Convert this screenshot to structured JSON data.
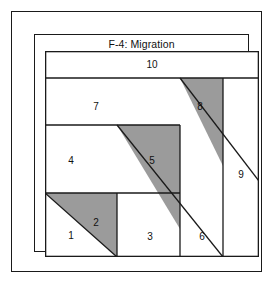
{
  "card": {
    "title": "F-4: Migration",
    "caption": "Foundation Paper Piecing Pattern A"
  },
  "colors": {
    "fabric_light": "#ffffff",
    "fabric_dark": "#9b9b9b",
    "seam_line": "#1a1a1a",
    "page_background": "#ffffff",
    "text": "#111111"
  },
  "pattern": {
    "name": "Foundation Paper Piecing Pattern A",
    "block_width": 214,
    "block_height": 206,
    "piece_count": 10,
    "pieces": [
      {
        "number": "1",
        "fabric": "light",
        "shape": "triangle",
        "points": "0,142 72,206 0,206",
        "label_x": 26,
        "label_y": 185
      },
      {
        "number": "2",
        "fabric": "dark",
        "shape": "triangle",
        "points": "0,142 72,142 72,206",
        "label_x": 51,
        "label_y": 172
      },
      {
        "number": "3",
        "fabric": "light",
        "shape": "polygon",
        "points": "72,142 135,142 135,206 72,206",
        "label_x": 105,
        "label_y": 186
      },
      {
        "number": "4",
        "fabric": "light",
        "shape": "triangle",
        "points": "0,74 72,74 72,142 0,142",
        "label_x": 26,
        "label_y": 110
      },
      {
        "number": "5",
        "fabric": "dark",
        "shape": "triangle",
        "points": "72,74 135,74 135,178",
        "label_x": 107,
        "label_y": 110
      },
      {
        "number": "6",
        "fabric": "light",
        "shape": "polygon",
        "points": "135,142 178,142 178,206 135,206",
        "label_x": 157,
        "label_y": 186
      },
      {
        "number": "7",
        "fabric": "light",
        "shape": "polygon",
        "points": "0,27 135,27 135,74 0,74",
        "label_x": 51,
        "label_y": 56
      },
      {
        "number": "8",
        "fabric": "dark",
        "shape": "triangle",
        "points": "135,27 178,27 178,115",
        "label_x": 155,
        "label_y": 56
      },
      {
        "number": "9",
        "fabric": "light",
        "shape": "rectangle",
        "points": "178,27 214,27 214,206 178,206",
        "label_x": 196,
        "label_y": 124
      },
      {
        "number": "10",
        "fabric": "light",
        "shape": "rectangle",
        "points": "0,0 214,0 214,27 0,27",
        "label_x": 107,
        "label_y": 14
      }
    ],
    "seams": [
      "0,27 214,27",
      "0,74 135,74",
      "0,142 135,142",
      "72,142 72,206",
      "135,74 135,206",
      "178,27 178,206",
      "0,142 72,206",
      "72,74 178,206",
      "135,27 214,130"
    ]
  }
}
